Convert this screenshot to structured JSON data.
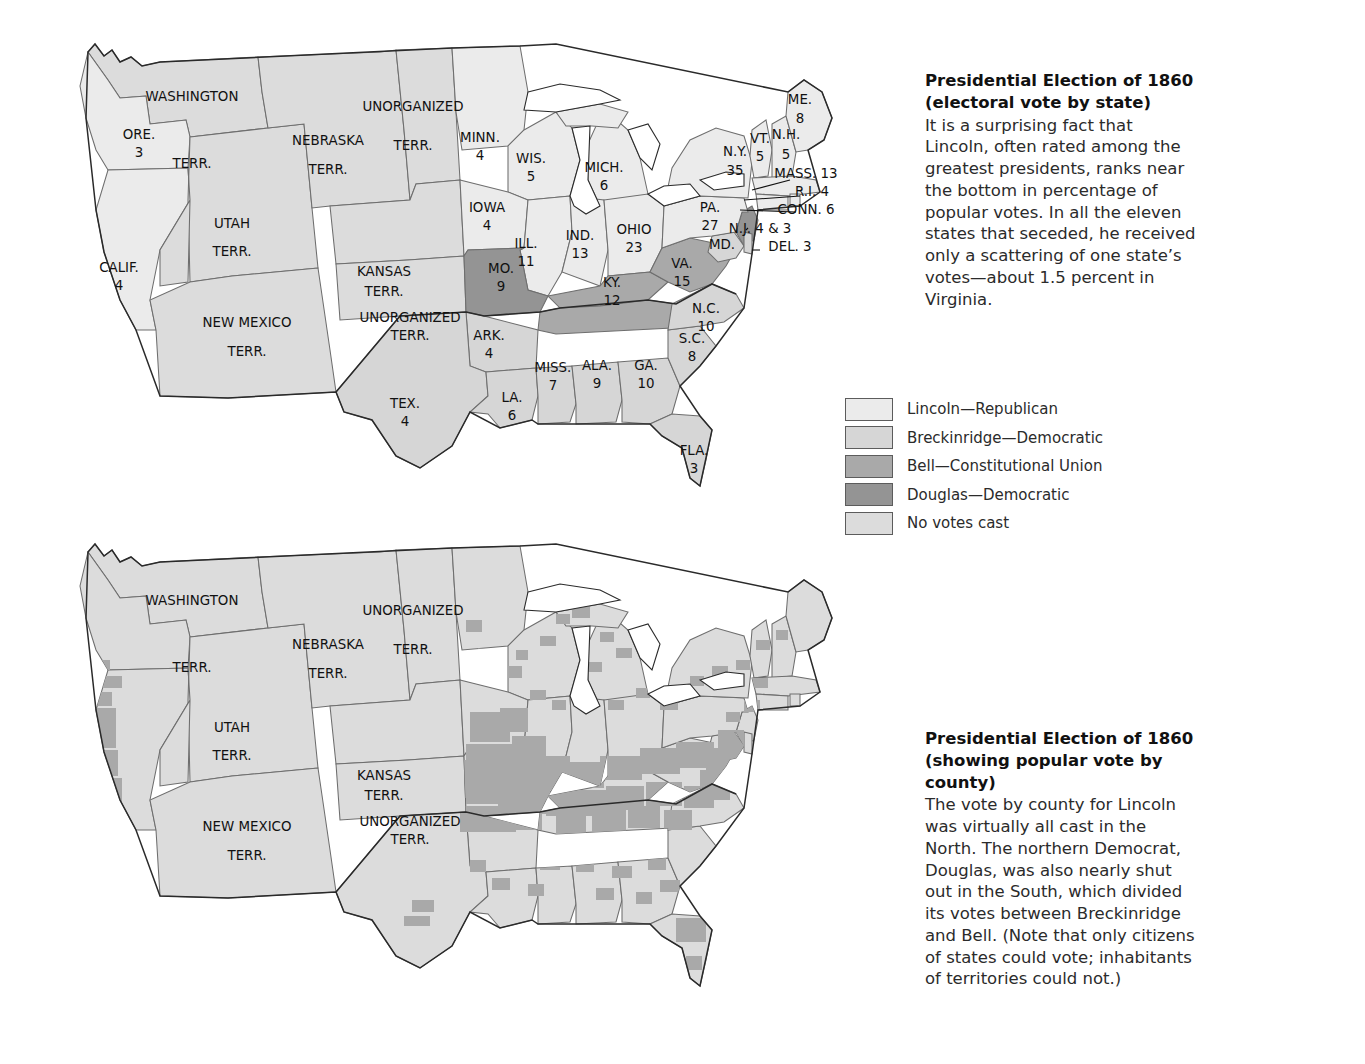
{
  "palette": {
    "lincoln": "#ebebeb",
    "breckinridge": "#d6d6d6",
    "bell": "#a9a9a9",
    "douglas": "#949494",
    "no_votes": "#dcdcdc",
    "border": "#6e6e6e",
    "outline": "#2a2a2a",
    "background": "#ffffff",
    "text": "#2b2b2b"
  },
  "top_caption": {
    "title_line1": "Presidential Election of 1860",
    "title_line2": "(electoral vote by state)",
    "body": "It is a surprising fact that Lincoln, often rated among the greatest presidents, ranks near the bottom in percentage of popular votes. In all the eleven states that seceded, he received only a scattering of one state’s votes—about 1.5 percent in Virginia."
  },
  "bottom_caption": {
    "title_line1": "Presidential Election of 1860",
    "title_line2": "(showing popular vote by county)",
    "body": "The vote by county for Lincoln was virtually all cast in the North. The northern Democrat, Douglas, was also nearly shut out in the South, which divided its votes between Breckinridge and Bell. (Note that only citizens of states could vote; inhabitants of territories could not.)"
  },
  "legend": {
    "items": [
      {
        "label": "Lincoln—Republican",
        "color": "#ebebeb"
      },
      {
        "label": "Breckinridge—Democratic",
        "color": "#d6d6d6"
      },
      {
        "label": "Bell—Constitutional Union",
        "color": "#a9a9a9"
      },
      {
        "label": "Douglas—Democratic",
        "color": "#949494"
      },
      {
        "label": "No votes cast",
        "color": "#dcdcdc"
      }
    ]
  },
  "chart_data": {
    "type": "map",
    "total_electoral_votes": 303,
    "legend_position": "center-right",
    "candidates": [
      "Lincoln—Republican",
      "Breckinridge—Democratic",
      "Bell—Constitutional Union",
      "Douglas—Democratic",
      "No votes cast"
    ],
    "states": [
      {
        "name": "ORE.",
        "votes": "3",
        "winner": "Lincoln"
      },
      {
        "name": "CALIF.",
        "votes": "4",
        "winner": "Lincoln"
      },
      {
        "name": "MINN.",
        "votes": "4",
        "winner": "Lincoln"
      },
      {
        "name": "WIS.",
        "votes": "5",
        "winner": "Lincoln"
      },
      {
        "name": "MICH.",
        "votes": "6",
        "winner": "Lincoln"
      },
      {
        "name": "IOWA",
        "votes": "4",
        "winner": "Lincoln"
      },
      {
        "name": "ILL.",
        "votes": "11",
        "winner": "Lincoln"
      },
      {
        "name": "IND.",
        "votes": "13",
        "winner": "Lincoln"
      },
      {
        "name": "OHIO",
        "votes": "23",
        "winner": "Lincoln"
      },
      {
        "name": "PA.",
        "votes": "27",
        "winner": "Lincoln"
      },
      {
        "name": "N.Y.",
        "votes": "35",
        "winner": "Lincoln"
      },
      {
        "name": "VT.",
        "votes": "5",
        "winner": "Lincoln"
      },
      {
        "name": "N.H.",
        "votes": "5",
        "winner": "Lincoln"
      },
      {
        "name": "ME.",
        "votes": "8",
        "winner": "Lincoln"
      },
      {
        "name": "MASS.",
        "votes": "13",
        "winner": "Lincoln"
      },
      {
        "name": "R.I.",
        "votes": "4",
        "winner": "Lincoln"
      },
      {
        "name": "CONN.",
        "votes": "6",
        "winner": "Lincoln"
      },
      {
        "name": "N.J.",
        "votes": "4 & 3",
        "winner": "Lincoln/Douglas split"
      },
      {
        "name": "MO.",
        "votes": "9",
        "winner": "Douglas"
      },
      {
        "name": "VA.",
        "votes": "15",
        "winner": "Bell"
      },
      {
        "name": "KY.",
        "votes": "12",
        "winner": "Bell"
      },
      {
        "name": "TENN.",
        "votes": "12",
        "winner": "Bell"
      },
      {
        "name": "DEL.",
        "votes": "3",
        "winner": "Breckinridge"
      },
      {
        "name": "MD.",
        "votes": "8",
        "winner": "Breckinridge"
      },
      {
        "name": "N.C.",
        "votes": "10",
        "winner": "Breckinridge"
      },
      {
        "name": "S.C.",
        "votes": "8",
        "winner": "Breckinridge"
      },
      {
        "name": "GA.",
        "votes": "10",
        "winner": "Breckinridge"
      },
      {
        "name": "FLA.",
        "votes": "3",
        "winner": "Breckinridge"
      },
      {
        "name": "ALA.",
        "votes": "9",
        "winner": "Breckinridge"
      },
      {
        "name": "MISS.",
        "votes": "7",
        "winner": "Breckinridge"
      },
      {
        "name": "LA.",
        "votes": "6",
        "winner": "Breckinridge"
      },
      {
        "name": "ARK.",
        "votes": "4",
        "winner": "Breckinridge"
      },
      {
        "name": "TEX.",
        "votes": "4",
        "winner": "Breckinridge"
      }
    ],
    "territories": [
      "WASHINGTON TERR.",
      "NEBRASKA TERR.",
      "UTAH TERR.",
      "NEW MEXICO TERR.",
      "KANSAS TERR.",
      "UNORGANIZED TERR."
    ]
  },
  "map_top": {
    "labels": [
      {
        "name": "washington",
        "l1": "WASHINGTON",
        "l2": "TERR.",
        "x": 192,
        "y": 101,
        "y2": 168
      },
      {
        "name": "oregon",
        "l1": "ORE.",
        "l2": "3",
        "x": 139,
        "y": 139,
        "y2": 157
      },
      {
        "name": "california",
        "l1": "CALIF.",
        "l2": "4",
        "x": 119,
        "y": 272,
        "y2": 290
      },
      {
        "name": "utah",
        "l1": "UTAH",
        "l2": "TERR.",
        "x": 232,
        "y": 228,
        "y2": 256
      },
      {
        "name": "new-mexico",
        "l1": "NEW MEXICO",
        "l2": "TERR.",
        "x": 247,
        "y": 327,
        "y2": 356
      },
      {
        "name": "nebraska",
        "l1": "NEBRASKA",
        "l2": "TERR.",
        "x": 328,
        "y": 145,
        "y2": 174
      },
      {
        "name": "kansas",
        "l1": "KANSAS",
        "l2": "TERR.",
        "x": 384,
        "y": 276,
        "y2": 296
      },
      {
        "name": "unorg-north",
        "l1": "UNORGANIZED",
        "l2": "TERR.",
        "x": 413,
        "y": 111,
        "y2": 150
      },
      {
        "name": "unorg-indian",
        "l1": "UNORGANIZED",
        "l2": "TERR.",
        "x": 410,
        "y": 322,
        "y2": 340
      },
      {
        "name": "minnesota",
        "l1": "MINN.",
        "l2": "4",
        "x": 480,
        "y": 142,
        "y2": 160
      },
      {
        "name": "wisconsin",
        "l1": "WIS.",
        "l2": "5",
        "x": 531,
        "y": 163,
        "y2": 181
      },
      {
        "name": "michigan",
        "l1": "MICH.",
        "l2": "6",
        "x": 604,
        "y": 172,
        "y2": 190
      },
      {
        "name": "iowa",
        "l1": "IOWA",
        "l2": "4",
        "x": 487,
        "y": 212,
        "y2": 230
      },
      {
        "name": "illinois",
        "l1": "ILL.",
        "l2": "11",
        "x": 526,
        "y": 248,
        "y2": 266
      },
      {
        "name": "indiana",
        "l1": "IND.",
        "l2": "13",
        "x": 580,
        "y": 240,
        "y2": 258
      },
      {
        "name": "ohio",
        "l1": "OHIO",
        "l2": "23",
        "x": 634,
        "y": 234,
        "y2": 252
      },
      {
        "name": "missouri",
        "l1": "MO.",
        "l2": "9",
        "x": 501,
        "y": 273,
        "y2": 291
      },
      {
        "name": "arkansas",
        "l1": "ARK.",
        "l2": "4",
        "x": 489,
        "y": 340,
        "y2": 358
      },
      {
        "name": "texas",
        "l1": "TEX.",
        "l2": "4",
        "x": 405,
        "y": 408,
        "y2": 426
      },
      {
        "name": "louisiana",
        "l1": "LA.",
        "l2": "6",
        "x": 512,
        "y": 402,
        "y2": 420
      },
      {
        "name": "mississippi",
        "l1": "MISS.",
        "l2": "7",
        "x": 553,
        "y": 372,
        "y2": 390
      },
      {
        "name": "alabama",
        "l1": "ALA.",
        "l2": "9",
        "x": 597,
        "y": 370,
        "y2": 388
      },
      {
        "name": "georgia",
        "l1": "GA.",
        "l2": "10",
        "x": 646,
        "y": 370,
        "y2": 388
      },
      {
        "name": "florida",
        "l1": "FLA.",
        "l2": "3",
        "x": 694,
        "y": 455,
        "y2": 473
      },
      {
        "name": "south-carolina",
        "l1": "S.C.",
        "l2": "8",
        "x": 692,
        "y": 343,
        "y2": 361
      },
      {
        "name": "north-carolina",
        "l1": "N.C.",
        "l2": "10",
        "x": 706,
        "y": 313,
        "y2": 331
      },
      {
        "name": "kentucky",
        "l1": "KY.",
        "l2": "12",
        "x": 612,
        "y": 287,
        "y2": 305
      },
      {
        "name": "virginia",
        "l1": "VA.",
        "l2": "15",
        "x": 682,
        "y": 268,
        "y2": 286
      },
      {
        "name": "pennsylvania",
        "l1": "PA.",
        "l2": "27",
        "x": 710,
        "y": 212,
        "y2": 230
      },
      {
        "name": "new-york",
        "l1": "N.Y.",
        "l2": "35",
        "x": 735,
        "y": 156,
        "y2": 175
      },
      {
        "name": "maine",
        "l1": "ME.",
        "l2": "8",
        "x": 800,
        "y": 104,
        "y2": 123
      },
      {
        "name": "vermont",
        "l1": "VT.",
        "l2": "5",
        "x": 760,
        "y": 143,
        "y2": 161
      },
      {
        "name": "new-hampshire",
        "l1": "N.H.",
        "l2": "5",
        "x": 786,
        "y": 139,
        "y2": 159
      }
    ],
    "callouts": [
      {
        "name": "massachusetts",
        "text": "MASS. 13",
        "x": 806,
        "y": 178
      },
      {
        "name": "rhode-island",
        "text": "R.I. 4",
        "x": 812,
        "y": 196
      },
      {
        "name": "connecticut",
        "text": "CONN. 6",
        "x": 806,
        "y": 214
      },
      {
        "name": "new-jersey",
        "text": "N.J. 4 & 3",
        "x": 760,
        "y": 233
      },
      {
        "name": "delaware",
        "text": "DEL. 3",
        "x": 790,
        "y": 251
      },
      {
        "name": "maryland",
        "text": "MD.",
        "x": 722,
        "y": 249
      }
    ]
  },
  "map_bottom": {
    "labels": [
      {
        "name": "washington",
        "l1": "WASHINGTON",
        "l2": "TERR.",
        "x": 192,
        "y": 605,
        "y2": 672
      },
      {
        "name": "nebraska",
        "l1": "NEBRASKA",
        "l2": "TERR.",
        "x": 328,
        "y": 649,
        "y2": 678
      },
      {
        "name": "utah",
        "l1": "UTAH",
        "l2": "TERR.",
        "x": 232,
        "y": 732,
        "y2": 760
      },
      {
        "name": "new-mexico",
        "l1": "NEW MEXICO",
        "l2": "TERR.",
        "x": 247,
        "y": 831,
        "y2": 860
      },
      {
        "name": "kansas",
        "l1": "KANSAS",
        "l2": "TERR.",
        "x": 384,
        "y": 780,
        "y2": 800
      },
      {
        "name": "unorg-north",
        "l1": "UNORGANIZED",
        "l2": "TERR.",
        "x": 413,
        "y": 615,
        "y2": 654
      },
      {
        "name": "unorg-indian",
        "l1": "UNORGANIZED",
        "l2": "TERR.",
        "x": 410,
        "y": 826,
        "y2": 844
      }
    ]
  }
}
